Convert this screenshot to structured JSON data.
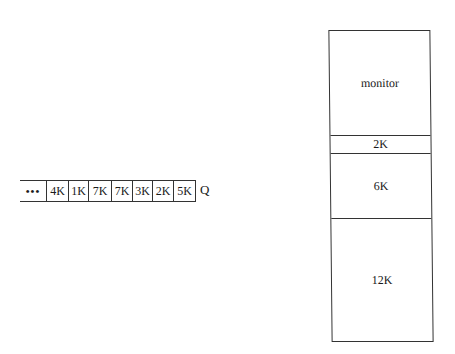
{
  "queue": {
    "leading_ellipsis": "•••",
    "jobs": [
      "4K",
      "1K",
      "7K",
      "7K",
      "3K",
      "2K",
      "5K"
    ],
    "label": "Q"
  },
  "memory": {
    "segments": [
      {
        "label": "monitor",
        "top": 0,
        "height": 104
      },
      {
        "label": "2K",
        "top": 104,
        "height": 18
      },
      {
        "label": "6K",
        "top": 122,
        "height": 65
      },
      {
        "label": "12K",
        "top": 187,
        "height": 125
      }
    ]
  }
}
